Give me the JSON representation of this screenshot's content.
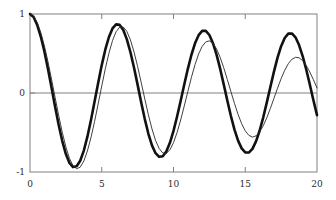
{
  "chart_data": {
    "type": "line",
    "title": "",
    "xlabel": "",
    "ylabel": "",
    "xlim": [
      0,
      20
    ],
    "ylim": [
      -1,
      1
    ],
    "xticks": [
      0,
      5,
      10,
      15,
      20
    ],
    "xtick_labels": [
      "0",
      "5",
      "10",
      "15",
      "20"
    ],
    "yticks": [
      -1,
      0,
      1
    ],
    "ytick_labels": [
      "-1",
      "0",
      "1"
    ],
    "grid": false,
    "legend": "none",
    "zero_line": true,
    "frame": "box",
    "colors": {
      "thick_curve": "#111111",
      "thin_curve": "#2a2a2a",
      "axis": "#808080",
      "zero_line": "#808080",
      "background": "#ffffff",
      "tick_text": "#2b2b2b"
    },
    "series": [
      {
        "name": "damped-oscillation-thick",
        "style": "solid",
        "line_width": 2.6,
        "color": "#111111",
        "model": "exp(-0.035*t)*cos(1.0*t)",
        "x": [
          0.0,
          0.25,
          0.5,
          0.75,
          1.0,
          1.25,
          1.5,
          1.75,
          2.0,
          2.25,
          2.5,
          2.75,
          3.0,
          3.25,
          3.5,
          3.75,
          4.0,
          4.25,
          4.5,
          4.75,
          5.0,
          5.25,
          5.5,
          5.75,
          6.0,
          6.25,
          6.5,
          6.75,
          7.0,
          7.25,
          7.5,
          7.75,
          8.0,
          8.25,
          8.5,
          8.75,
          9.0,
          9.25,
          9.5,
          9.75,
          10.0,
          10.25,
          10.5,
          10.75,
          11.0,
          11.25,
          11.5,
          11.75,
          12.0,
          12.25,
          12.5,
          12.75,
          13.0,
          13.25,
          13.5,
          13.75,
          14.0,
          14.25,
          14.5,
          14.75,
          15.0,
          15.25,
          15.5,
          15.75,
          16.0,
          16.25,
          16.5,
          16.75,
          17.0,
          17.25,
          17.5,
          17.75,
          18.0,
          18.25,
          18.5,
          18.75,
          19.0,
          19.25,
          19.5,
          19.75,
          20.0
        ],
        "y": [
          1.0,
          0.961,
          0.862,
          0.715,
          0.528,
          0.308,
          0.069,
          -0.173,
          -0.405,
          -0.608,
          -0.773,
          -0.886,
          -0.938,
          -0.928,
          -0.857,
          -0.729,
          -0.553,
          -0.341,
          -0.109,
          0.128,
          0.353,
          0.551,
          0.709,
          0.818,
          0.869,
          0.862,
          0.797,
          0.679,
          0.516,
          0.32,
          0.103,
          -0.119,
          -0.33,
          -0.516,
          -0.663,
          -0.762,
          -0.808,
          -0.8,
          -0.74,
          -0.63,
          -0.48,
          -0.298,
          -0.098,
          0.108,
          0.306,
          0.484,
          0.629,
          0.732,
          0.786,
          0.786,
          0.734,
          0.631,
          0.486,
          0.308,
          0.109,
          -0.096,
          -0.291,
          -0.463,
          -0.603,
          -0.701,
          -0.752,
          -0.754,
          -0.707,
          -0.613,
          -0.478,
          -0.311,
          -0.122,
          0.077,
          0.271,
          0.447,
          0.592,
          0.696,
          0.751,
          0.754,
          0.705,
          0.607,
          0.468,
          0.297,
          0.107,
          -0.091,
          -0.28
        ]
      },
      {
        "name": "damped-oscillation-thin",
        "style": "solid",
        "line_width": 0.9,
        "color": "#2a2a2a",
        "model": "exp(-0.055*t)*cos(0.9*t)",
        "x": [
          0.0,
          0.25,
          0.5,
          0.75,
          1.0,
          1.25,
          1.5,
          1.75,
          2.0,
          2.25,
          2.5,
          2.75,
          3.0,
          3.25,
          3.5,
          3.75,
          4.0,
          4.25,
          4.5,
          4.75,
          5.0,
          5.25,
          5.5,
          5.75,
          6.0,
          6.25,
          6.5,
          6.75,
          7.0,
          7.25,
          7.5,
          7.75,
          8.0,
          8.25,
          8.5,
          8.75,
          9.0,
          9.25,
          9.5,
          9.75,
          10.0,
          10.25,
          10.5,
          10.75,
          11.0,
          11.25,
          11.5,
          11.75,
          12.0,
          12.25,
          12.5,
          12.75,
          13.0,
          13.25,
          13.5,
          13.75,
          14.0,
          14.25,
          14.5,
          14.75,
          15.0,
          15.25,
          15.5,
          15.75,
          16.0,
          16.25,
          16.5,
          16.75,
          17.0,
          17.25,
          17.5,
          17.75,
          18.0,
          18.25,
          18.5,
          18.75,
          19.0,
          19.25,
          19.5,
          19.75,
          20.0
        ],
        "y": [
          1.0,
          0.972,
          0.893,
          0.766,
          0.598,
          0.398,
          0.175,
          -0.057,
          -0.286,
          -0.499,
          -0.683,
          -0.827,
          -0.921,
          -0.959,
          -0.939,
          -0.862,
          -0.734,
          -0.563,
          -0.36,
          -0.138,
          0.089,
          0.308,
          0.504,
          0.663,
          0.776,
          0.834,
          0.835,
          0.779,
          0.671,
          0.519,
          0.335,
          0.132,
          -0.076,
          -0.276,
          -0.455,
          -0.6,
          -0.703,
          -0.759,
          -0.764,
          -0.719,
          -0.629,
          -0.499,
          -0.341,
          -0.164,
          0.02,
          0.199,
          0.36,
          0.494,
          0.591,
          0.647,
          0.66,
          0.629,
          0.558,
          0.452,
          0.32,
          0.172,
          0.018,
          -0.132,
          -0.271,
          -0.389,
          -0.479,
          -0.536,
          -0.558,
          -0.543,
          -0.495,
          -0.416,
          -0.314,
          -0.195,
          -0.068,
          0.061,
          0.182,
          0.288,
          0.371,
          0.427,
          0.452,
          0.446,
          0.41,
          0.348,
          0.265,
          0.168,
          0.064
        ]
      }
    ]
  }
}
